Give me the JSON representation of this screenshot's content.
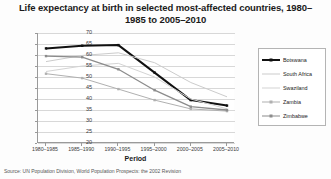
{
  "chart_data": {
    "type": "line",
    "title": "Life expectancy at birth in selected most-affected countries, 1980–1985 to 2005–2010",
    "xlabel": "Period",
    "ylabel": "Years",
    "ylim": [
      20,
      70
    ],
    "ytick_step": 5,
    "yticks": [
      70,
      65,
      60,
      55,
      50,
      45,
      40,
      35,
      30,
      25,
      20
    ],
    "categories": [
      "1980–1985",
      "1985–1990",
      "1990–1995",
      "1995–2000",
      "2000–2005",
      "2005–2010"
    ],
    "grid": true,
    "legend_position": "right",
    "series": [
      {
        "name": "Botswana",
        "color": "#111111",
        "width": 2.0,
        "marker": true,
        "values": [
          63.0,
          64.2,
          64.5,
          52.0,
          39.5,
          37.0
        ]
      },
      {
        "name": "South Africa",
        "color": "#cccccc",
        "width": 1.0,
        "marker": false,
        "values": [
          57.0,
          59.8,
          61.0,
          56.5,
          47.5,
          41.0
        ]
      },
      {
        "name": "Swaziland",
        "color": "#d4d4d4",
        "width": 1.0,
        "marker": false,
        "values": [
          52.5,
          55.0,
          56.2,
          50.0,
          40.0,
          35.5
        ]
      },
      {
        "name": "Zambia",
        "color": "#b0b0b0",
        "width": 1.0,
        "marker": true,
        "values": [
          51.5,
          49.5,
          44.5,
          39.5,
          35.5,
          34.5
        ]
      },
      {
        "name": "Zimbabwe",
        "color": "#8c8c8c",
        "width": 1.3,
        "marker": true,
        "values": [
          59.5,
          59.0,
          53.5,
          44.0,
          36.5,
          35.0
        ]
      }
    ]
  },
  "source": {
    "text": "Source: UN Population Division, World Population Prospects: the 2002 Revision"
  }
}
